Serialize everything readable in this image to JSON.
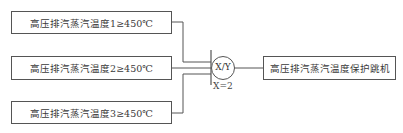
{
  "inputs": [
    {
      "label": "高压排汽蒸汽温度1≥450℃"
    },
    {
      "label": "高压排汽蒸汽温度2≥450℃"
    },
    {
      "label": "高压排汽蒸汽温度3≥450℃"
    }
  ],
  "gate": {
    "label": "X/Y",
    "param": "X=2"
  },
  "output": {
    "label": "高压排汽蒸汽温度保护跳机"
  }
}
